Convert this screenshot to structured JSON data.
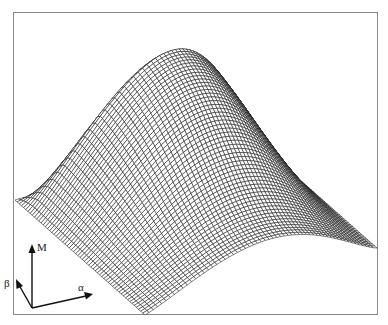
{
  "figure": {
    "frame_color": "#888888",
    "mesh_color": "#1a1a1a",
    "background": "#ffffff"
  },
  "axes_indicator": {
    "vertical_label": "M",
    "depth_label": "β",
    "horizontal_label": "α"
  },
  "surface": {
    "grid_u": 60,
    "grid_v": 60,
    "base_origin": [
      145,
      315
    ],
    "u_vector": [
      232,
      -67
    ],
    "v_vector": [
      -130,
      -115
    ],
    "height_vector": [
      26,
      -132
    ]
  }
}
